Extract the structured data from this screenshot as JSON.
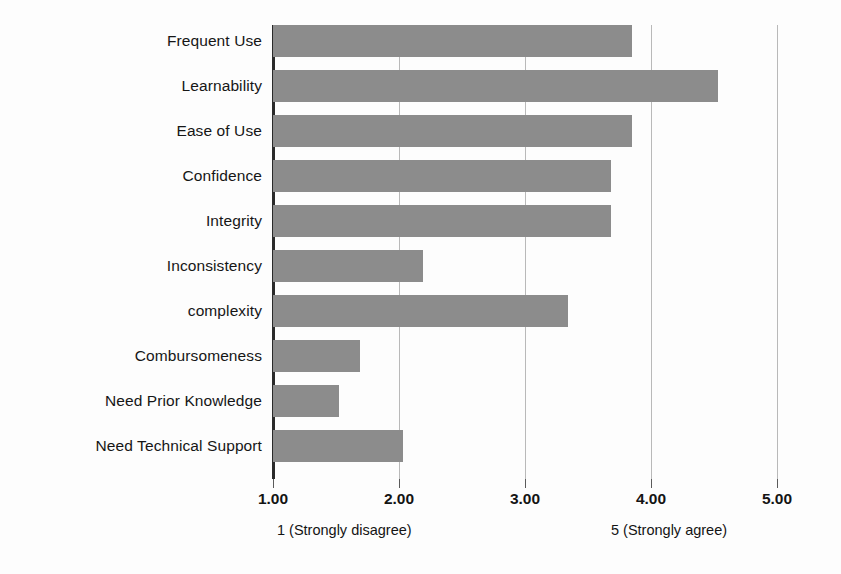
{
  "chart_data": {
    "type": "bar",
    "orientation": "horizontal",
    "title": "",
    "xlabel": "",
    "ylabel": "",
    "xlim": [
      1.0,
      5.0
    ],
    "grid": true,
    "legend": null,
    "bar_color": "#8c8c8c",
    "axis_color": "#2a2a2a",
    "gridline_color": "#b9b9b9",
    "background": "#fdfdfd",
    "categories": [
      "Frequent Use",
      "Learnability",
      "Ease of Use",
      "Confidence",
      "Integrity",
      "Inconsistency",
      "complexity",
      "Combursomeness",
      "Need Prior Knowledge",
      "Need Technical Support"
    ],
    "values": [
      3.85,
      4.53,
      3.85,
      3.68,
      3.68,
      2.19,
      3.34,
      1.69,
      1.52,
      2.03
    ],
    "xticks": [
      1.0,
      2.0,
      3.0,
      4.0,
      5.0
    ],
    "xtick_labels": [
      "1.00",
      "2.00",
      "3.00",
      "4.00",
      "5.00"
    ],
    "annotations": {
      "low_anchor": "1  (Strongly disagree)",
      "high_anchor": "5  (Strongly agree)"
    }
  }
}
